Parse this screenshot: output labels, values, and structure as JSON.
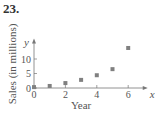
{
  "problem": {
    "number": "23."
  },
  "chart_data": {
    "type": "scatter",
    "title": "",
    "xlabel": "Year",
    "ylabel": "Sales (in millions)",
    "x_axis_letter": "x",
    "y_axis_letter": "y",
    "x": [
      0,
      1,
      2,
      3,
      4,
      5,
      6
    ],
    "y": [
      0.3,
      0.7,
      1.7,
      2.8,
      4.4,
      6.5,
      13.8
    ],
    "x_ticks": [
      "0",
      "2",
      "4",
      "6"
    ],
    "y_ticks": [
      "0",
      "5",
      "10"
    ],
    "xlim": [
      0,
      6.8
    ],
    "ylim": [
      0,
      16
    ],
    "grid": false,
    "legend": null,
    "marker": "square",
    "marker_color": "#808080"
  }
}
